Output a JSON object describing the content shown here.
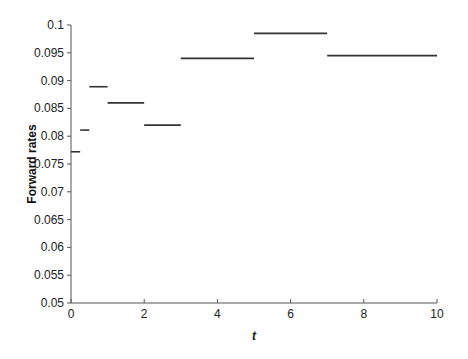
{
  "chart_data": {
    "type": "line",
    "subtype": "step-segments",
    "title": "",
    "xlabel": "t",
    "ylabel": "Forward rates",
    "xlim": [
      0,
      10
    ],
    "ylim": [
      0.05,
      0.1
    ],
    "xticks": [
      0,
      2,
      4,
      6,
      8,
      10
    ],
    "xtick_labels": [
      "0",
      "2",
      "4",
      "6",
      "8",
      "10"
    ],
    "yticks": [
      0.05,
      0.055,
      0.06,
      0.065,
      0.07,
      0.075,
      0.08,
      0.085,
      0.09,
      0.095,
      0.1
    ],
    "ytick_labels": [
      "0.05",
      "0.055",
      "0.06",
      "0.065",
      "0.07",
      "0.075",
      "0.08",
      "0.085",
      "0.09",
      "0.095",
      "0.1"
    ],
    "grid": false,
    "legend": null,
    "series": [
      {
        "name": "Forward rates",
        "color": "#333333",
        "segments": [
          {
            "x0": 0,
            "x1": 0.25,
            "y": 0.0772
          },
          {
            "x0": 0.25,
            "x1": 0.5,
            "y": 0.0811
          },
          {
            "x0": 0.5,
            "x1": 1,
            "y": 0.0889
          },
          {
            "x0": 1,
            "x1": 2,
            "y": 0.086
          },
          {
            "x0": 2,
            "x1": 3,
            "y": 0.082
          },
          {
            "x0": 3,
            "x1": 5,
            "y": 0.094
          },
          {
            "x0": 5,
            "x1": 7,
            "y": 0.0985
          },
          {
            "x0": 7,
            "x1": 10,
            "y": 0.0945
          }
        ]
      }
    ]
  },
  "layout": {
    "plot_left": 71,
    "plot_right": 437,
    "plot_top": 25,
    "plot_bottom": 303
  }
}
